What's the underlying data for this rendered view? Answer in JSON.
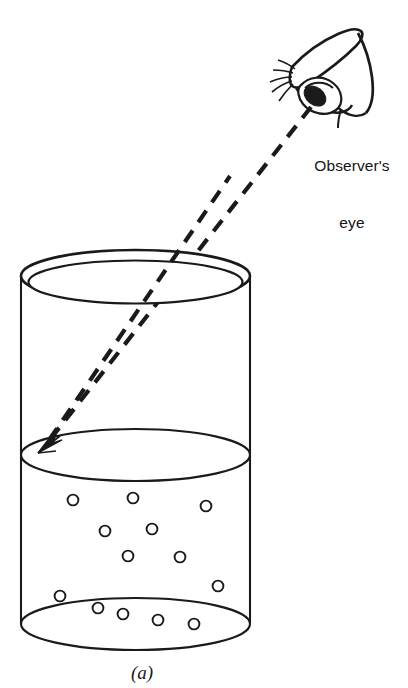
{
  "figure": {
    "caption": "(a)",
    "observer_label_line1": "Observer's",
    "observer_label_line2": "eye",
    "colors": {
      "ink": "#1a1a1a",
      "background": "#ffffff",
      "ray": "#1a1a1a"
    },
    "cylinder": {
      "left_x": 21,
      "right_x": 250,
      "top_rim_center_y": 276,
      "liquid_surface_center_y": 455,
      "bottom_center_y": 624,
      "ellipse_ry": 26,
      "rim_inner_offset": 7
    },
    "ray": {
      "from_x": 311,
      "from_y": 107,
      "to_x": 39,
      "to_y": 451,
      "dash_pattern": "14 10",
      "stroke_width": 4.2
    },
    "bubbles": [
      {
        "cx": 73,
        "cy": 500,
        "r": 5.4
      },
      {
        "cx": 133,
        "cy": 498,
        "r": 5.4
      },
      {
        "cx": 206,
        "cy": 506,
        "r": 5.4
      },
      {
        "cx": 105,
        "cy": 531,
        "r": 5.4
      },
      {
        "cx": 152,
        "cy": 529,
        "r": 5.4
      },
      {
        "cx": 128,
        "cy": 556,
        "r": 5.4
      },
      {
        "cx": 180,
        "cy": 557,
        "r": 5.4
      },
      {
        "cx": 218,
        "cy": 586,
        "r": 5.4
      },
      {
        "cx": 60,
        "cy": 596,
        "r": 5.4
      },
      {
        "cx": 98,
        "cy": 608,
        "r": 5.4
      },
      {
        "cx": 123,
        "cy": 614,
        "r": 5.4
      },
      {
        "cx": 158,
        "cy": 620,
        "r": 5.4
      },
      {
        "cx": 194,
        "cy": 624,
        "r": 5.4
      }
    ]
  }
}
